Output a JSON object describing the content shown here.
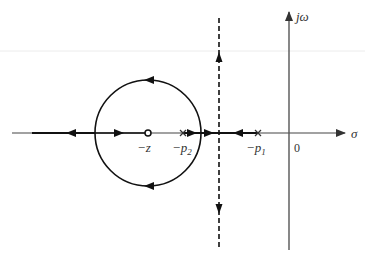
{
  "diagram": {
    "type": "root-locus",
    "axes": {
      "real_axis_label": "σ",
      "imag_axis_label": "jω",
      "origin_label": "0"
    },
    "zeros": [
      {
        "label": "−z",
        "marker": "circle"
      }
    ],
    "poles": [
      {
        "label": "−p",
        "subscript": "2",
        "marker": "cross"
      },
      {
        "label": "−p",
        "subscript": "1",
        "marker": "cross"
      }
    ],
    "asymptote": {
      "style": "dashed",
      "orientation": "vertical"
    },
    "locus_circle": {
      "centered_on": "zero"
    },
    "colors": {
      "locus": "#111111",
      "axis": "#555555",
      "background": "#ffffff"
    }
  }
}
